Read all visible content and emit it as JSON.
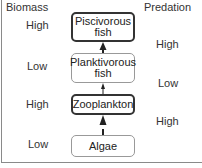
{
  "columns": {
    "left_header": "Biomass",
    "right_header": "Predation"
  },
  "levels": [
    {
      "name_line1": "Piscivorous",
      "name_line2": "fish",
      "biomass": "High",
      "emphasis": "bold"
    },
    {
      "name_line1": "Planktivorous",
      "name_line2": "fish",
      "biomass": "Low",
      "emphasis": "thin"
    },
    {
      "name_line1": "Zooplankton",
      "name_line2": "",
      "biomass": "High",
      "emphasis": "bold"
    },
    {
      "name_line1": "Algae",
      "name_line2": "",
      "biomass": "Low",
      "emphasis": "thin"
    }
  ],
  "predation": [
    {
      "between": "Planktivorous fish -> Piscivorous fish",
      "value": "High",
      "arrow": "bold"
    },
    {
      "between": "Zooplankton -> Planktivorous fish",
      "value": "Low",
      "arrow": "thin"
    },
    {
      "between": "Algae -> Zooplankton",
      "value": "High",
      "arrow": "bold"
    }
  ],
  "colors": {
    "line": "#333333",
    "thin_border": "#999999",
    "frame": "#8a8a8a"
  }
}
